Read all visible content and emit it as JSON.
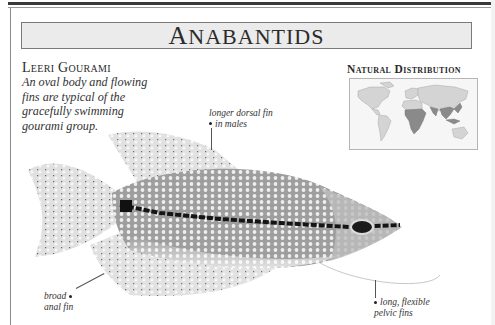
{
  "page": {
    "title": "Anabantids",
    "title_display": {
      "first": "A",
      "rest": "NABANTIDS"
    }
  },
  "species": {
    "name": "Leeri Gourami",
    "description": "An oval body and flowing fins are typical of the gracefully swimming gourami group."
  },
  "distribution": {
    "heading": "Natural Distribution",
    "highlighted_regions": [
      "Sub-Saharan Africa",
      "South Asia",
      "Southeast Asia"
    ],
    "colors": {
      "land": "#d4d4d4",
      "highlight": "#8a8a8a",
      "background": "#f6f6f6"
    }
  },
  "annotations": [
    {
      "id": "dorsal",
      "lines": [
        "longer dorsal fin",
        "in males"
      ]
    },
    {
      "id": "anal",
      "lines": [
        "broad",
        "anal fin"
      ]
    },
    {
      "id": "pelvic",
      "lines": [
        "long, flexible",
        "pelvic fins"
      ]
    }
  ],
  "illustration": {
    "subject": "Leeri gourami (pearl gourami) side view",
    "colors": {
      "body": "#a9a9a9",
      "stripe": "#151515",
      "fin": "#cfcfcf",
      "spots": "#f4f4f4"
    }
  }
}
